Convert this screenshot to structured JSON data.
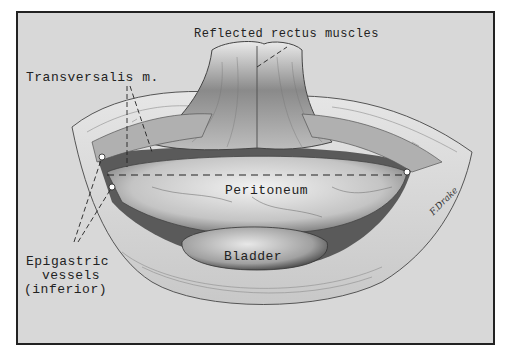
{
  "figure": {
    "type": "anatomical-illustration",
    "style": "grayscale pencil drawing",
    "colors": {
      "background": "#d8d8d8",
      "ink": "#222222",
      "tissue_light": "#eeeeee",
      "tissue_dark": "#6a6a6a",
      "frame": "#222222"
    }
  },
  "labels": {
    "reflected_rectus": "Reflected rectus  muscles",
    "transversalis": "Transversalis  m.",
    "peritoneum": "Peritoneum",
    "bladder": "Bladder",
    "epigastric_line1": "Epigastric",
    "epigastric_line2": "vessels",
    "epigastric_line3": "(inferior)"
  },
  "signature": "F.Drake"
}
